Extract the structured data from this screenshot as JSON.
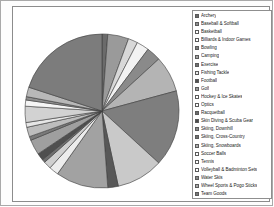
{
  "chart_data": {
    "type": "pie",
    "title": "",
    "legend_position": "right",
    "grid": false,
    "categories": [
      "Archery",
      "Baseball & Softball",
      "Basketball",
      "Billiards & Indoor Games",
      "Bowling",
      "Camping",
      "Exercise",
      "Fishing Tackle",
      "Football",
      "Golf",
      "Hockey & Ice Skates",
      "Optics",
      "Racquetball",
      "Skin Diving & Scuba Gear",
      "Skiing, Downhill",
      "Skiing, Cross-Country",
      "Skiing, Snowboards",
      "Soccer Balls",
      "Tennis",
      "Volleyball & Badminton Sets",
      "Water Skis",
      "Wheel Sports & Pogo Sticks",
      "Team Goods"
    ],
    "values": [
      1.2,
      4.4,
      2.0,
      2.6,
      3.0,
      7.6,
      16.0,
      9.8,
      2.2,
      11.0,
      2.0,
      1.6,
      0.7,
      1.5,
      3.2,
      0.8,
      2.0,
      1.0,
      3.4,
      1.3,
      0.7,
      2.0,
      20.0
    ],
    "colors": [
      "#6b6b6b",
      "#9a9a9a",
      "#d8d8d8",
      "#f2f2f2",
      "#8a8a8a",
      "#b4b4b4",
      "#7e7e7e",
      "#c9c9c9",
      "#585858",
      "#a2a2a2",
      "#ededed",
      "#cfcfcf",
      "#6f6f6f",
      "#4f4f4f",
      "#9f9f9f",
      "#7a7a7a",
      "#bdbdbd",
      "#e6e6e6",
      "#d2d2d2",
      "#f5f5f5",
      "#8f8f8f",
      "#b8b8b8",
      "#7c7c7c"
    ],
    "swatch_fills": [
      "#6b6b6b",
      "#8f8f8f",
      "#ffffff",
      "#ffffff",
      "#7e7e7e",
      "#a6a6a6",
      "#6f6f6f",
      "#ededed",
      "#4f4f4f",
      "#9a9a9a",
      "#ffffff",
      "#ffffff",
      "#6b6b6b",
      "#4a4a4a",
      "#8a8a8a",
      "#707070",
      "#b0b0b0",
      "#ffffff",
      "#ffffff",
      "#ffffff",
      "#888888",
      "#ababab",
      "#777777"
    ],
    "xlabel": "",
    "ylabel": ""
  }
}
